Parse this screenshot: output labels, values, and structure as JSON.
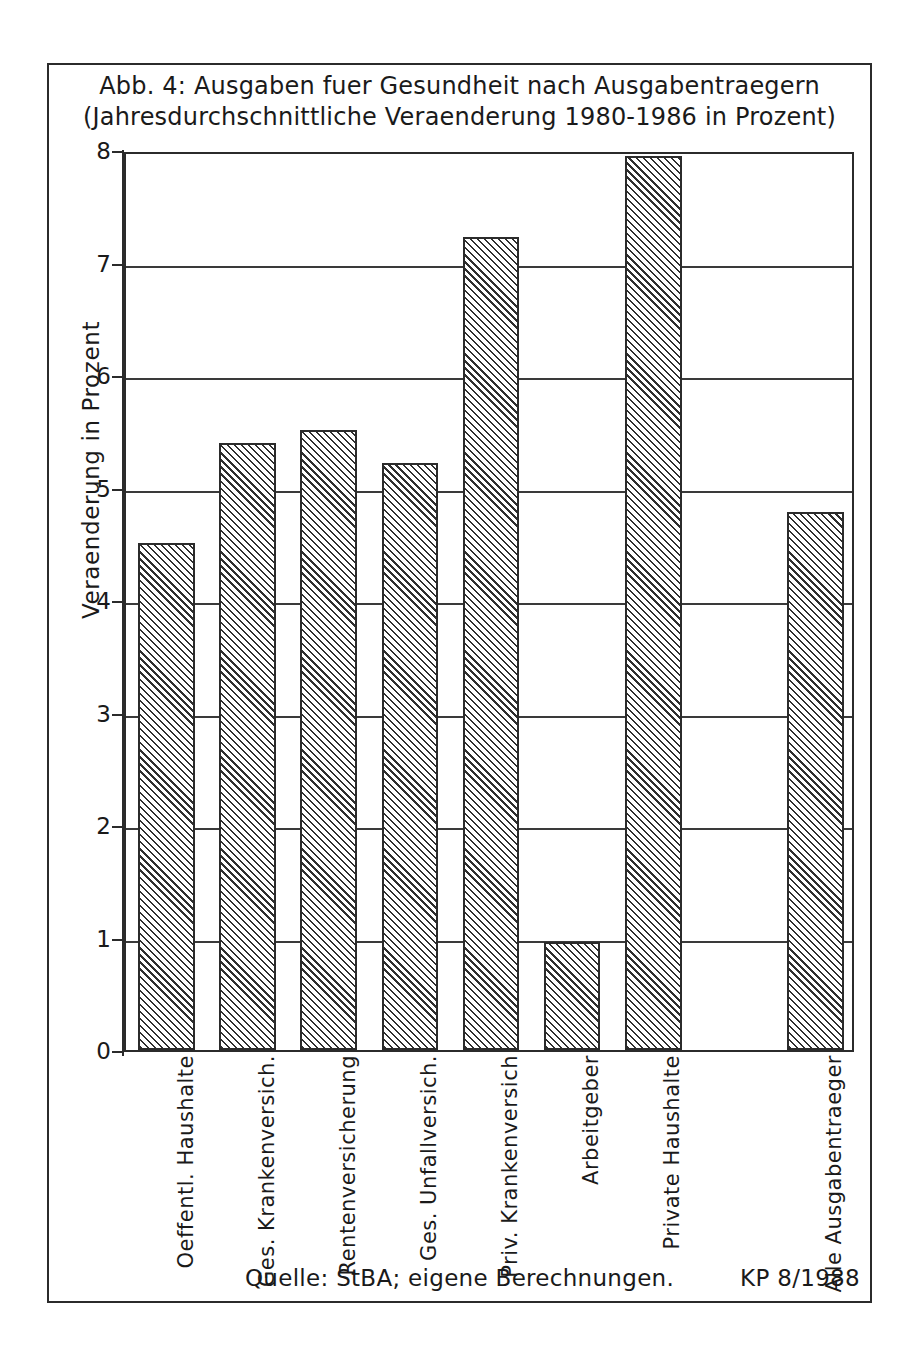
{
  "figure": {
    "title_line1": "Abb. 4: Ausgaben fuer Gesundheit nach Ausgabentraegern",
    "title_line2": "(Jahresdurchschnittliche Veraenderung 1980-1986 in Prozent)",
    "source_note": "Quelle: StBA; eigene Berechnungen.",
    "credit": "KP 8/1988",
    "frame_color": "#2b2b2b",
    "bar_outline_color": "#2b2b2b",
    "bar_hatch_color": "#2f2f2f",
    "background_color": "#ffffff"
  },
  "chart_data": {
    "type": "bar",
    "title": "Abb. 4: Ausgaben fuer Gesundheit nach Ausgabentraegern (Jahresdurchschnittliche Veraenderung 1980-1986 in Prozent)",
    "xlabel": "",
    "ylabel": "Veraenderung in Prozent",
    "ylim": [
      0,
      8
    ],
    "yticks": [
      0,
      1,
      2,
      3,
      4,
      5,
      6,
      7,
      8
    ],
    "ytick_labels": [
      "0",
      "1",
      "2",
      "3",
      "4",
      "5",
      "6",
      "7",
      "8"
    ],
    "grid": true,
    "grid_axis": "y",
    "legend": false,
    "categories": [
      "Oeffentl. Haushalte",
      "Ges. Krankenversich.",
      "Rentenversicherung",
      "Ges. Unfallversich.",
      "Priv. Krankenversich",
      "Arbeitgeber",
      "Private Haushalte",
      "Alle Ausgabentraeger"
    ],
    "values": [
      4.51,
      5.4,
      5.51,
      5.22,
      7.23,
      0.96,
      7.95,
      4.78
    ],
    "bar_slots": [
      0,
      1,
      2,
      3,
      4,
      5,
      6,
      8
    ],
    "slot_count": 9,
    "note": "Slot 7 is an empty gap separating the single-payer bars from the total bar."
  }
}
